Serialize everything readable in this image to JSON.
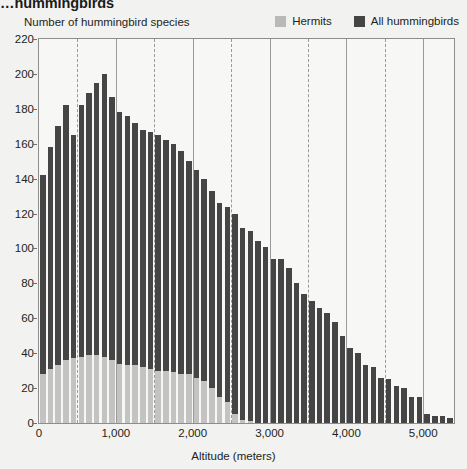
{
  "title": "…hummingbirds",
  "legend": {
    "position": "top-right",
    "entries": [
      {
        "label": "Hermits",
        "color": "#b9b9b7",
        "icon": "legend-swatch-icon"
      },
      {
        "label": "All hummingbirds",
        "color": "#454545",
        "icon": "legend-swatch-icon"
      }
    ]
  },
  "axis": {
    "y_title": "Number of hummingbird species",
    "x_title": "Altitude (meters)",
    "y_ticks": [
      "0",
      "20",
      "40",
      "60",
      "80",
      "100",
      "120",
      "140",
      "160",
      "180",
      "200",
      "220"
    ],
    "x_ticks": [
      "0",
      "1,000",
      "2,000",
      "3,000",
      "4,000",
      "5,000"
    ]
  },
  "chart_data": {
    "type": "bar",
    "subtype": "overlaid-histogram",
    "title": "…hummingbirds",
    "xlabel": "Altitude (meters)",
    "ylabel": "Number of hummingbird species",
    "xlim": [
      0,
      5400
    ],
    "ylim": [
      0,
      220
    ],
    "ytick_step": 20,
    "xtick_step": 1000,
    "grid": {
      "major_x_every": 1000,
      "minor_x_every": 500,
      "major_style": "solid",
      "minor_style": "dashed"
    },
    "bin_width": 100,
    "x": [
      0,
      100,
      200,
      300,
      400,
      500,
      600,
      700,
      800,
      900,
      1000,
      1100,
      1200,
      1300,
      1400,
      1500,
      1600,
      1700,
      1800,
      1900,
      2000,
      2100,
      2200,
      2300,
      2400,
      2500,
      2600,
      2700,
      2800,
      2900,
      3000,
      3100,
      3200,
      3300,
      3400,
      3500,
      3600,
      3700,
      3800,
      3900,
      4000,
      4100,
      4200,
      4300,
      4400,
      4500,
      4600,
      4700,
      4800,
      4900,
      5000,
      5100,
      5200,
      5300
    ],
    "series": [
      {
        "name": "All hummingbirds",
        "color": "#454545",
        "values": [
          142,
          158,
          170,
          182,
          165,
          182,
          189,
          195,
          200,
          187,
          178,
          176,
          172,
          168,
          167,
          165,
          162,
          160,
          156,
          150,
          145,
          140,
          133,
          126,
          124,
          120,
          112,
          110,
          104,
          101,
          94,
          94,
          89,
          80,
          74,
          70,
          66,
          63,
          58,
          50,
          43,
          40,
          33,
          32,
          26,
          25,
          21,
          20,
          15,
          15,
          5,
          4,
          4,
          3
        ]
      },
      {
        "name": "Hermits",
        "color": "#c3c3c1",
        "values": [
          28,
          31,
          33,
          36,
          37,
          38,
          39,
          39,
          38,
          36,
          34,
          33,
          33,
          32,
          31,
          30,
          30,
          29,
          28,
          28,
          26,
          24,
          20,
          15,
          12,
          5,
          2,
          1,
          0,
          0,
          0,
          0,
          0,
          0,
          0,
          0,
          0,
          0,
          0,
          0,
          0,
          0,
          0,
          0,
          0,
          0,
          0,
          0,
          0,
          0,
          0,
          0,
          0,
          0
        ]
      }
    ]
  }
}
